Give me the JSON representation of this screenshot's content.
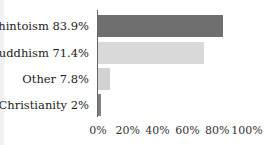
{
  "chart_data": {
    "type": "bar",
    "orientation": "horizontal",
    "categories": [
      "Shintoism 83.9%",
      "Buddhism 71.4%",
      "Other 7.8%",
      "Christianity 2%"
    ],
    "values": [
      83.9,
      71.4,
      7.8,
      2
    ],
    "colors": [
      "#6f6f6f",
      "#d9d9d9",
      "#d2d2d2",
      "#808080"
    ],
    "title": "",
    "xlabel": "",
    "ylabel": "",
    "xlim": [
      0,
      100
    ],
    "xticks": [
      "0%",
      "20%",
      "40%",
      "60%",
      "80%",
      "100%"
    ],
    "grid": false,
    "legend": "none"
  }
}
